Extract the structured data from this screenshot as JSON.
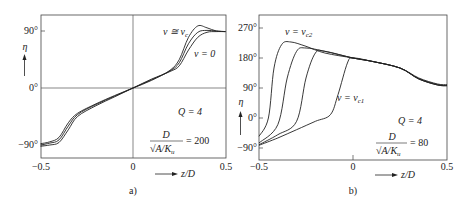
{
  "chart_data": [
    {
      "type": "line",
      "panel": "a)",
      "xlabel": "z/D",
      "ylabel": "η",
      "xlim": [
        -0.5,
        0.5
      ],
      "ylim": [
        -100,
        110
      ],
      "x_ticks": [
        "-0.5",
        "0",
        "0.5"
      ],
      "y_ticks": [
        "90°",
        "0°",
        "-90°"
      ],
      "annotations": [
        "v ≅ v_c",
        "v = 0",
        "Q = 4",
        "D/√(A/K_u) = 200"
      ],
      "series": [
        {
          "name": "v ≅ v_c",
          "x": [
            -0.5,
            -0.45,
            -0.4,
            -0.35,
            -0.3,
            -0.2,
            -0.1,
            0,
            0.1,
            0.2,
            0.25,
            0.3,
            0.35,
            0.4,
            0.45,
            0.5
          ],
          "values": [
            -88,
            -85,
            -78,
            -55,
            -40,
            -25,
            -12,
            0,
            12,
            28,
            45,
            80,
            98,
            95,
            90,
            89
          ]
        },
        {
          "name": "intermediate",
          "x": [
            -0.5,
            -0.45,
            -0.4,
            -0.35,
            -0.3,
            -0.2,
            -0.1,
            0,
            0.1,
            0.2,
            0.25,
            0.3,
            0.35,
            0.4,
            0.45,
            0.5
          ],
          "values": [
            -90,
            -87,
            -82,
            -60,
            -42,
            -26,
            -13,
            0,
            13,
            27,
            40,
            70,
            88,
            91,
            90,
            89
          ]
        },
        {
          "name": "v = 0",
          "x": [
            -0.5,
            -0.45,
            -0.4,
            -0.35,
            -0.3,
            -0.2,
            -0.1,
            0,
            0.1,
            0.2,
            0.25,
            0.3,
            0.35,
            0.4,
            0.45,
            0.5
          ],
          "values": [
            -92,
            -90,
            -86,
            -66,
            -45,
            -28,
            -14,
            0,
            14,
            26,
            35,
            60,
            80,
            88,
            89,
            89
          ]
        }
      ]
    },
    {
      "type": "line",
      "panel": "b)",
      "xlabel": "z/D",
      "ylabel": "η",
      "xlim": [
        -0.5,
        0.5
      ],
      "ylim": [
        -125,
        310
      ],
      "x_ticks": [
        "-0.5",
        "0",
        "0.5"
      ],
      "y_ticks": [
        "270°",
        "180°",
        "90°",
        "0°",
        "-90°"
      ],
      "annotations": [
        "v = v_c2",
        "v = v_c1",
        "Q = 4",
        "D/√(A/K_u) = 80"
      ],
      "series": [
        {
          "name": "v = v_c2",
          "x": [
            -0.5,
            -0.45,
            -0.42,
            -0.38,
            -0.33,
            -0.25,
            -0.15,
            0,
            0.1,
            0.25,
            0.35,
            0.45,
            0.5
          ],
          "values": [
            -55,
            0,
            150,
            220,
            228,
            215,
            195,
            180,
            170,
            150,
            120,
            102,
            100
          ]
        },
        {
          "name": "curve 2",
          "x": [
            -0.5,
            -0.4,
            -0.35,
            -0.3,
            -0.25,
            -0.15,
            0,
            0.1,
            0.25,
            0.35,
            0.45,
            0.5
          ],
          "values": [
            -75,
            -20,
            120,
            200,
            210,
            200,
            180,
            170,
            150,
            118,
            100,
            98
          ]
        },
        {
          "name": "curve 3",
          "x": [
            -0.5,
            -0.4,
            -0.3,
            -0.25,
            -0.2,
            -0.15,
            0,
            0.1,
            0.25,
            0.35,
            0.45,
            0.5
          ],
          "values": [
            -80,
            -50,
            -10,
            120,
            195,
            200,
            180,
            170,
            150,
            117,
            99,
            97
          ]
        },
        {
          "name": "v = v_c1",
          "x": [
            -0.5,
            -0.4,
            -0.3,
            -0.2,
            -0.12,
            -0.08,
            -0.03,
            0,
            0.1,
            0.25,
            0.35,
            0.45,
            0.5
          ],
          "values": [
            -82,
            -60,
            -35,
            -10,
            10,
            70,
            165,
            180,
            170,
            150,
            117,
            99,
            97
          ]
        }
      ]
    }
  ],
  "panels": {
    "a": {
      "caption": "a)",
      "y_axis_symbol": "η",
      "x_axis_label": "z/D",
      "ticks_y": [
        "90°",
        "0°",
        "−90°"
      ],
      "ticks_x": [
        "−0.5",
        "0",
        "0.5"
      ],
      "label_top": "v ≅ v",
      "label_top_sub": "c",
      "label_bottom": "v = 0",
      "param_q": "Q = 4",
      "param_num": "D",
      "param_den": "√A/K",
      "param_den_sub": "u",
      "param_val": "= 200"
    },
    "b": {
      "caption": "b)",
      "y_axis_symbol": "η",
      "x_axis_label": "z/D",
      "ticks_y": [
        "270°",
        "180°",
        "90°",
        "0°",
        "−90°"
      ],
      "ticks_x": [
        "−0.5",
        "0",
        "0.5"
      ],
      "label_top": "v = v",
      "label_top_sub": "c2",
      "label_mid": "v = v",
      "label_mid_sub": "c1",
      "param_q": "Q = 4",
      "param_num": "D",
      "param_den": "√A/K",
      "param_den_sub": "u",
      "param_val": "= 80"
    }
  }
}
